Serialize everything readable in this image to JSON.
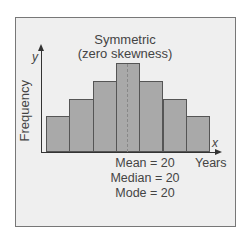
{
  "chart_data": {
    "type": "bar",
    "title": "Symmetric",
    "subtitle": "(zero skewness)",
    "xlabel": "Years",
    "ylabel": "Frequency",
    "x_axis_symbol": "x",
    "y_axis_symbol": "y",
    "categories": [
      "1",
      "2",
      "3",
      "4",
      "5",
      "6",
      "7"
    ],
    "values": [
      2,
      3,
      4,
      5,
      4,
      3,
      2
    ],
    "annotations": [
      "Mean = 20",
      "Median = 20",
      "Mode = 20"
    ],
    "grid": false,
    "legend": null,
    "center_line": "dashed vertical line at mean/median/mode"
  },
  "colors": {
    "bar_fill": "#a9a9a9",
    "bar_border": "#555555",
    "panel_bg": "#efefef"
  }
}
